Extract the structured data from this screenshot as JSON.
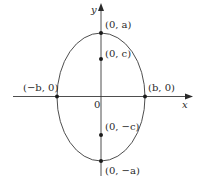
{
  "diagram": {
    "type": "ellipse-vertical-major-axis",
    "axes": {
      "x_label": "x",
      "y_label": "y",
      "origin_label": "0"
    },
    "points": [
      {
        "id": "top-vertex",
        "label": "(0, a)"
      },
      {
        "id": "upper-focus",
        "label": "(0, c)"
      },
      {
        "id": "lower-focus",
        "label": "(0, −c)"
      },
      {
        "id": "bottom-vertex",
        "label": "(0, −a)"
      },
      {
        "id": "left-vertex",
        "label": "(−b, 0)"
      },
      {
        "id": "right-vertex",
        "label": "(b, 0)"
      }
    ],
    "colors": {
      "stroke": "#3a3a3a",
      "text": "#2a2a2a",
      "background": "#ffffff"
    }
  }
}
